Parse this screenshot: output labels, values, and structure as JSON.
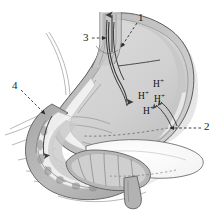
{
  "figure": {
    "background_color": "#ffffff",
    "width": 219,
    "height": 212
  },
  "palette": {
    "outline": "#4a4a4a",
    "serosa_outer": "#b9b9b9",
    "muscularis": "#a9a9a9",
    "lumen_light": "#d6d6d6",
    "lumen_mid": "#c4c4c4",
    "fundus_fill": "#cfcfcf",
    "mucosa_white": "#f4f4f4",
    "pancreas_fill": "#fdfdfd",
    "duodenum_fill": "#b0b0b0",
    "dark_fold": "#8e8e8e",
    "arrow_dark": "#3a3a3a",
    "label_text": "#1a1a1a",
    "dash_leader": "#2b2b2b",
    "shadow": "#dcdcdc"
  },
  "callouts": [
    {
      "id": "callout-1",
      "label": "1",
      "x": 140,
      "y": 18,
      "leader": "dashed-diagonal-down-left"
    },
    {
      "id": "callout-2",
      "label": "2",
      "x": 205,
      "y": 124,
      "leader": "dashed-horizontal-left"
    },
    {
      "id": "callout-3",
      "label": "3",
      "x": 86,
      "y": 36,
      "leader": "dashed-horizontal-right"
    },
    {
      "id": "callout-4",
      "label": "4",
      "x": 14,
      "y": 84,
      "leader": "dashed-diagonal-down-right"
    }
  ],
  "ions": [
    {
      "id": "ion-1",
      "symbol": "H",
      "charge": "+",
      "x": 156,
      "y": 84
    },
    {
      "id": "ion-2",
      "symbol": "H",
      "charge": "+",
      "x": 142,
      "y": 95
    },
    {
      "id": "ion-3",
      "symbol": "H",
      "charge": "+",
      "x": 157,
      "y": 98
    },
    {
      "id": "ion-4",
      "symbol": "H",
      "charge": "+",
      "x": 146,
      "y": 110
    }
  ],
  "flow_arrows": [
    {
      "id": "esophagus-up-arrow",
      "direction": "up",
      "description": "arrow ascending within esophagus"
    },
    {
      "id": "gastric-down-arrow",
      "direction": "down",
      "description": "arrow descending into gastric body"
    },
    {
      "id": "acid-secretion-arrow-inner",
      "direction": "up-left",
      "description": "curved arrow from antral wall toward lumen"
    },
    {
      "id": "acid-secretion-arrow-outer",
      "direction": "up-left",
      "description": "second curved arrow from antral wall toward lumen"
    },
    {
      "id": "duodenal-flow-arrow",
      "direction": "down",
      "description": "arrow following duodenal descending limb"
    }
  ]
}
